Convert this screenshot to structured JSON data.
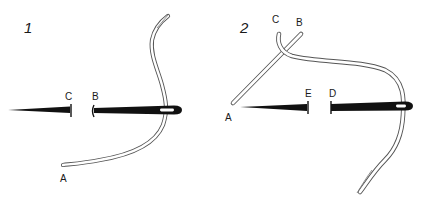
{
  "figure": {
    "type": "stitch-instruction-diagram",
    "colors": {
      "ink": "#111111",
      "thread_fill": "#ffffff",
      "thread_outline": "#555555",
      "background": "#ffffff"
    },
    "panels": [
      {
        "number": "1",
        "points": {
          "A": "A",
          "B": "B",
          "C": "C"
        }
      },
      {
        "number": "2",
        "points": {
          "A": "A",
          "B": "B",
          "C": "C",
          "D": "D",
          "E": "E"
        }
      }
    ]
  }
}
